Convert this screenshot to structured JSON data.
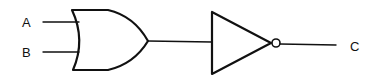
{
  "diagram": {
    "type": "logic-circuit",
    "inputs": [
      {
        "label": "A"
      },
      {
        "label": "B"
      }
    ],
    "gates": [
      {
        "type": "OR",
        "inputs": [
          "A",
          "B"
        ]
      },
      {
        "type": "NOT",
        "inputs": [
          "OR"
        ]
      }
    ],
    "output": {
      "label": "C"
    }
  }
}
